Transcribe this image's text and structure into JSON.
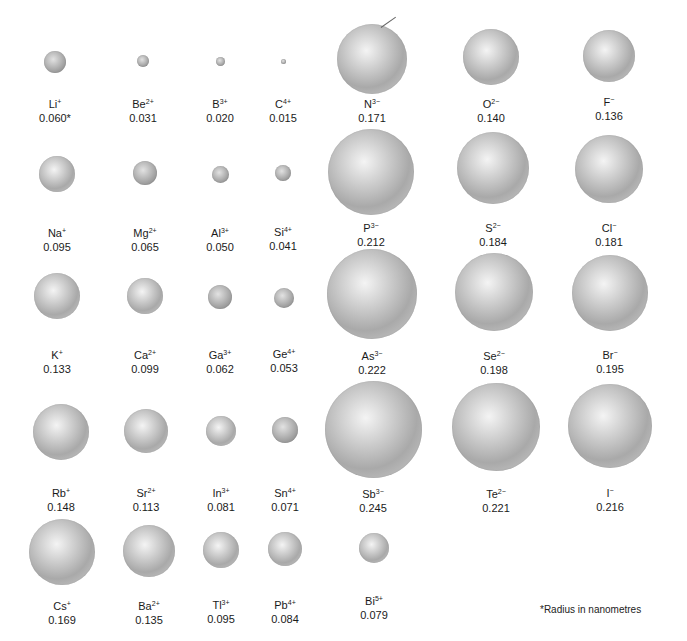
{
  "figure": {
    "footnote": "*Radius in nanometres",
    "unit": "nm"
  },
  "chart_data": {
    "type": "table",
    "unit": "nm",
    "note": "*Radius in nanometres",
    "rows": [
      [
        {
          "symbol": "Li",
          "charge": "+",
          "radius": "0.060*"
        },
        {
          "symbol": "Be",
          "charge": "2+",
          "radius": "0.031"
        },
        {
          "symbol": "B",
          "charge": "3+",
          "radius": "0.020"
        },
        {
          "symbol": "C",
          "charge": "4+",
          "radius": "0.015"
        },
        {
          "symbol": "N",
          "charge": "3−",
          "radius": "0.171"
        },
        {
          "symbol": "O",
          "charge": "2−",
          "radius": "0.140"
        },
        {
          "symbol": "F",
          "charge": "−",
          "radius": "0.136"
        }
      ],
      [
        {
          "symbol": "Na",
          "charge": "+",
          "radius": "0.095"
        },
        {
          "symbol": "Mg",
          "charge": "2+",
          "radius": "0.065"
        },
        {
          "symbol": "Al",
          "charge": "3+",
          "radius": "0.050"
        },
        {
          "symbol": "Si",
          "charge": "4+",
          "radius": "0.041"
        },
        {
          "symbol": "P",
          "charge": "3−",
          "radius": "0.212"
        },
        {
          "symbol": "S",
          "charge": "2−",
          "radius": "0.184"
        },
        {
          "symbol": "Cl",
          "charge": "−",
          "radius": "0.181"
        }
      ],
      [
        {
          "symbol": "K",
          "charge": "+",
          "radius": "0.133"
        },
        {
          "symbol": "Ca",
          "charge": "2+",
          "radius": "0.099"
        },
        {
          "symbol": "Ga",
          "charge": "3+",
          "radius": "0.062"
        },
        {
          "symbol": "Ge",
          "charge": "4+",
          "radius": "0.053"
        },
        {
          "symbol": "As",
          "charge": "3−",
          "radius": "0.222"
        },
        {
          "symbol": "Se",
          "charge": "2−",
          "radius": "0.198"
        },
        {
          "symbol": "Br",
          "charge": "−",
          "radius": "0.195"
        }
      ],
      [
        {
          "symbol": "Rb",
          "charge": "+",
          "radius": "0.148"
        },
        {
          "symbol": "Sr",
          "charge": "2+",
          "radius": "0.113"
        },
        {
          "symbol": "In",
          "charge": "3+",
          "radius": "0.081"
        },
        {
          "symbol": "Sn",
          "charge": "4+",
          "radius": "0.071"
        },
        {
          "symbol": "Sb",
          "charge": "3−",
          "radius": "0.245"
        },
        {
          "symbol": "Te",
          "charge": "2−",
          "radius": "0.221"
        },
        {
          "symbol": "I",
          "charge": "−",
          "radius": "0.216"
        }
      ],
      [
        {
          "symbol": "Cs",
          "charge": "+",
          "radius": "0.169"
        },
        {
          "symbol": "Ba",
          "charge": "2+",
          "radius": "0.135"
        },
        {
          "symbol": "Tl",
          "charge": "3+",
          "radius": "0.095"
        },
        {
          "symbol": "Pb",
          "charge": "4+",
          "radius": "0.084"
        },
        {
          "symbol": "Bi",
          "charge": "5+",
          "radius": "0.079"
        }
      ]
    ]
  },
  "layout": {
    "ions": [
      {
        "r": 0,
        "c": 0,
        "cx": 55,
        "cy": 62,
        "d": 22,
        "ly": 98
      },
      {
        "r": 0,
        "c": 1,
        "cx": 143,
        "cy": 61,
        "d": 12,
        "ly": 98
      },
      {
        "r": 0,
        "c": 2,
        "cx": 220,
        "cy": 61,
        "d": 9,
        "ly": 98
      },
      {
        "r": 0,
        "c": 3,
        "cx": 283,
        "cy": 61,
        "d": 5,
        "ly": 98
      },
      {
        "r": 0,
        "c": 4,
        "cx": 372,
        "cy": 59,
        "d": 70,
        "ly": 98
      },
      {
        "r": 0,
        "c": 5,
        "cx": 491,
        "cy": 57,
        "d": 56,
        "ly": 98
      },
      {
        "r": 0,
        "c": 6,
        "cx": 609,
        "cy": 56,
        "d": 52,
        "ly": 96
      },
      {
        "r": 1,
        "c": 0,
        "cx": 57,
        "cy": 174,
        "d": 36,
        "ly": 227
      },
      {
        "r": 1,
        "c": 1,
        "cx": 145,
        "cy": 173,
        "d": 24,
        "ly": 227
      },
      {
        "r": 1,
        "c": 2,
        "cx": 220,
        "cy": 174,
        "d": 17,
        "ly": 227
      },
      {
        "r": 1,
        "c": 3,
        "cx": 283,
        "cy": 173,
        "d": 16,
        "ly": 226
      },
      {
        "r": 1,
        "c": 4,
        "cx": 371,
        "cy": 172,
        "d": 86,
        "ly": 222
      },
      {
        "r": 1,
        "c": 5,
        "cx": 493,
        "cy": 168,
        "d": 72,
        "ly": 222
      },
      {
        "r": 1,
        "c": 6,
        "cx": 609,
        "cy": 169,
        "d": 68,
        "ly": 222
      },
      {
        "r": 2,
        "c": 0,
        "cx": 57,
        "cy": 296,
        "d": 46,
        "ly": 349
      },
      {
        "r": 2,
        "c": 1,
        "cx": 145,
        "cy": 296,
        "d": 36,
        "ly": 349
      },
      {
        "r": 2,
        "c": 2,
        "cx": 220,
        "cy": 297,
        "d": 24,
        "ly": 349
      },
      {
        "r": 2,
        "c": 3,
        "cx": 284,
        "cy": 298,
        "d": 20,
        "ly": 348
      },
      {
        "r": 2,
        "c": 4,
        "cx": 372,
        "cy": 294,
        "d": 90,
        "ly": 350
      },
      {
        "r": 2,
        "c": 5,
        "cx": 494,
        "cy": 292,
        "d": 78,
        "ly": 350
      },
      {
        "r": 2,
        "c": 6,
        "cx": 610,
        "cy": 293,
        "d": 76,
        "ly": 349
      },
      {
        "r": 3,
        "c": 0,
        "cx": 61,
        "cy": 432,
        "d": 56,
        "ly": 487
      },
      {
        "r": 3,
        "c": 1,
        "cx": 146,
        "cy": 431,
        "d": 44,
        "ly": 487
      },
      {
        "r": 3,
        "c": 2,
        "cx": 221,
        "cy": 431,
        "d": 30,
        "ly": 487
      },
      {
        "r": 3,
        "c": 3,
        "cx": 285,
        "cy": 430,
        "d": 26,
        "ly": 487
      },
      {
        "r": 3,
        "c": 4,
        "cx": 373,
        "cy": 429,
        "d": 97,
        "ly": 488
      },
      {
        "r": 3,
        "c": 5,
        "cx": 496,
        "cy": 427,
        "d": 88,
        "ly": 488
      },
      {
        "r": 3,
        "c": 6,
        "cx": 610,
        "cy": 426,
        "d": 84,
        "ly": 487
      },
      {
        "r": 4,
        "c": 0,
        "cx": 62,
        "cy": 552,
        "d": 66,
        "ly": 600
      },
      {
        "r": 4,
        "c": 1,
        "cx": 149,
        "cy": 551,
        "d": 52,
        "ly": 600
      },
      {
        "r": 4,
        "c": 2,
        "cx": 221,
        "cy": 550,
        "d": 36,
        "ly": 599
      },
      {
        "r": 4,
        "c": 3,
        "cx": 285,
        "cy": 549,
        "d": 34,
        "ly": 599
      },
      {
        "r": 4,
        "c": 4,
        "cx": 374,
        "cy": 548,
        "d": 30,
        "ly": 595
      }
    ]
  }
}
